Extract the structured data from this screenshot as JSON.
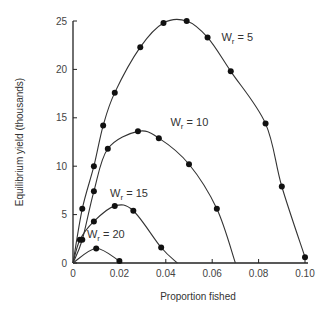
{
  "chart_data": {
    "type": "line",
    "title": "",
    "xlabel": "Proportion fished",
    "ylabel": "Equilibrium yield (thousands)",
    "xlim": [
      0,
      0.1
    ],
    "ylim": [
      0,
      25
    ],
    "xticks": [
      0,
      0.02,
      0.04,
      0.06,
      0.08,
      0.1
    ],
    "xtick_labels": [
      "0",
      "0.02",
      "0.04",
      "0.06",
      "0.08",
      "0.10"
    ],
    "yticks": [
      0,
      5,
      10,
      15,
      20,
      25
    ],
    "ytick_labels": [
      "0",
      "5",
      "10",
      "15",
      "20",
      "25"
    ],
    "grid": false,
    "legend": "inline labels",
    "series": [
      {
        "name": "Wr = 5",
        "label_sub": "r",
        "label_prefix": "W",
        "label_suffix": " = 5",
        "label_pos": [
          0.064,
          22.9
        ],
        "points": [
          [
            0,
            0
          ],
          [
            0.004,
            2.8
          ],
          [
            0.009,
            7.1
          ],
          [
            0.013,
            11.5
          ],
          [
            0.019,
            14.4
          ],
          [
            0.03,
            19.8
          ],
          [
            0.04,
            23.6
          ],
          [
            0.049,
            25.0
          ],
          [
            0.059,
            24.9
          ],
          [
            0.07,
            22.8
          ],
          [
            0.083,
            19.6
          ],
          [
            0.094,
            14.4
          ],
          [
            0.1,
            8.1
          ],
          [
            0.1,
            0.6
          ]
        ],
        "markers": [
          [
            0.004,
            5.6
          ],
          [
            0.009,
            10.0
          ],
          [
            0.013,
            14.2
          ],
          [
            0.018,
            17.6
          ],
          [
            0.029,
            22.3
          ],
          [
            0.039,
            24.8
          ],
          [
            0.049,
            25.0
          ],
          [
            0.058,
            23.3
          ],
          [
            0.068,
            19.8
          ],
          [
            0.083,
            14.4
          ],
          [
            0.09,
            7.9
          ],
          [
            0.1,
            0.6
          ]
        ]
      },
      {
        "name": "Wr = 10",
        "label_prefix": "W",
        "label_sub": "r",
        "label_suffix": " = 10",
        "label_pos": [
          0.042,
          14.2
        ],
        "markers": [
          [
            0.004,
            2.4
          ],
          [
            0.009,
            7.4
          ],
          [
            0.015,
            11.8
          ],
          [
            0.028,
            13.6
          ],
          [
            0.037,
            12.9
          ],
          [
            0.05,
            10.2
          ],
          [
            0.062,
            5.6
          ]
        ],
        "end": 0.07
      },
      {
        "name": "Wr = 15",
        "label_prefix": "W",
        "label_sub": "r",
        "label_suffix": " = 15",
        "label_pos": [
          0.016,
          6.8
        ],
        "markers": [
          [
            0.003,
            2.4
          ],
          [
            0.009,
            4.3
          ],
          [
            0.018,
            5.9
          ],
          [
            0.026,
            5.4
          ],
          [
            0.038,
            1.6
          ]
        ],
        "end": 0.045
      },
      {
        "name": "Wr = 20",
        "label_prefix": "W",
        "label_sub": "r",
        "label_suffix": " = 20",
        "label_pos": [
          0.006,
          2.6
        ],
        "markers": [
          [
            0.01,
            1.5
          ],
          [
            0.02,
            0.2
          ]
        ],
        "end": 0.021
      }
    ]
  }
}
